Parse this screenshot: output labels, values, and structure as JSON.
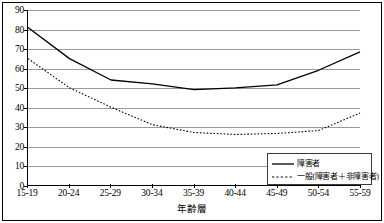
{
  "chart_data": {
    "type": "line",
    "title": "",
    "subtitle": "",
    "xlabel": "年齢層",
    "ylabel": "",
    "categories": [
      "15-19",
      "20-24",
      "25-29",
      "30-34",
      "35-39",
      "40-44",
      "45-49",
      "50-54",
      "55-59"
    ],
    "ylim": [
      0,
      90
    ],
    "ytick_step": 10,
    "yticks": [
      "90",
      "80",
      "70",
      "60",
      "50",
      "40",
      "30",
      "20",
      "10",
      "0"
    ],
    "grid": true,
    "legend_position": "bottom-right",
    "series": [
      {
        "name": "障害者",
        "style": "solid",
        "color": "#000000",
        "values": [
          81,
          65,
          54,
          52,
          49,
          50,
          51.5,
          59,
          68.5
        ]
      },
      {
        "name": "一般(障害者＋非障害者)",
        "style": "dotted",
        "color": "#000000",
        "values": [
          65,
          50,
          40,
          31,
          27,
          26,
          26.5,
          28,
          37
        ]
      }
    ]
  },
  "legend": {
    "entries": [
      {
        "label": "障害者",
        "icon": "solid-line-icon"
      },
      {
        "label": "一般(障害者＋非障害者)",
        "icon": "dotted-line-icon"
      }
    ]
  },
  "axes": {
    "x_title": "年齢層"
  }
}
